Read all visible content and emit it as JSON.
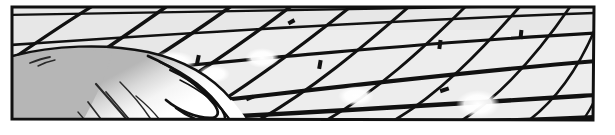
{
  "panel": {
    "kind": "manga-comic-panel",
    "caption": "",
    "width": 615,
    "height": 135,
    "border": {
      "color": "#111111",
      "thickness": 3,
      "corners": [
        [
          11,
          6
        ],
        [
          595,
          6
        ],
        [
          593,
          121
        ],
        [
          11,
          120
        ]
      ]
    },
    "colors": {
      "page_background": "#ffffff",
      "sky_cell_fill": "#e7e7e7",
      "sky_cell_fill_light": "#f6f6f6",
      "highlight_white": "#ffffff",
      "fence_wire": "#111111",
      "hair_base": "#b6b6b6",
      "hair_shadow": "#aaaaaa",
      "hair_highlight": "#f2f2f2",
      "ink_line": "#111111"
    },
    "scene": {
      "description": "Low-angle view of a chain-link / wire mesh fence seen in perspective against a blank sky, with a character's hair occupying the lower-left foreground.",
      "background_element": "wire-mesh-fence",
      "foreground_element": "character-hair",
      "screentone": "flat-gray",
      "speed_lines": false
    },
    "fence": {
      "name": "wire-mesh-fence",
      "wire_color": "#111111",
      "wire_thickness_near": 5,
      "wire_thickness_far": 2.2,
      "cell_fill": "#e7e7e7",
      "orientation": "diamond-perspective",
      "vanishing_hint": "right",
      "strand_count_a": 11,
      "strand_count_b": 9,
      "strands_a": [
        {
          "x1": 11,
          "y1": 60,
          "x2": 95,
          "y2": 6
        },
        {
          "x1": 11,
          "y1": 112,
          "x2": 168,
          "y2": 6
        },
        {
          "x1": 52,
          "y1": 120,
          "x2": 232,
          "y2": 6
        },
        {
          "x1": 118,
          "y1": 120,
          "x2": 292,
          "y2": 6
        },
        {
          "x1": 186,
          "y1": 120,
          "x2": 352,
          "y2": 6
        },
        {
          "x1": 254,
          "y1": 120,
          "x2": 410,
          "y2": 6
        },
        {
          "x1": 322,
          "y1": 120,
          "x2": 466,
          "y2": 6
        },
        {
          "x1": 390,
          "y1": 120,
          "x2": 520,
          "y2": 6
        },
        {
          "x1": 458,
          "y1": 120,
          "x2": 570,
          "y2": 6
        },
        {
          "x1": 524,
          "y1": 120,
          "x2": 594,
          "y2": 24
        },
        {
          "x1": 576,
          "y1": 120,
          "x2": 595,
          "y2": 88
        }
      ],
      "strands_b": [
        {
          "x1": 11,
          "y1": 14,
          "x2": 595,
          "y2": 6
        },
        {
          "x1": 11,
          "y1": 44,
          "x2": 595,
          "y2": 14
        },
        {
          "x1": 11,
          "y1": 80,
          "x2": 595,
          "y2": 34
        },
        {
          "x1": 11,
          "y1": 120,
          "x2": 595,
          "y2": 62
        },
        {
          "x1": 74,
          "y1": 120,
          "x2": 595,
          "y2": 96
        },
        {
          "x1": 240,
          "y1": 120,
          "x2": 595,
          "y2": 118
        }
      ],
      "knot_marks": 9
    },
    "hair": {
      "name": "character-hair",
      "fill": "#b6b6b6",
      "outline": "#111111",
      "outline_thickness": 2.5,
      "highlight_fill": "#f2f2f2",
      "strand_lines": 7,
      "bang_tips": 4,
      "occupies": "lower-left"
    },
    "highlights": [
      {
        "name": "sky-glare-a",
        "cx": 172,
        "cy": 62,
        "rx": 22,
        "ry": 10
      },
      {
        "name": "sky-glare-b",
        "cx": 214,
        "cy": 72,
        "rx": 14,
        "ry": 8
      },
      {
        "name": "sky-glare-c",
        "cx": 262,
        "cy": 58,
        "rx": 16,
        "ry": 9
      },
      {
        "name": "sky-glare-d",
        "cx": 356,
        "cy": 96,
        "rx": 17,
        "ry": 9
      },
      {
        "name": "sky-glare-e",
        "cx": 478,
        "cy": 104,
        "rx": 20,
        "ry": 13
      }
    ]
  }
}
